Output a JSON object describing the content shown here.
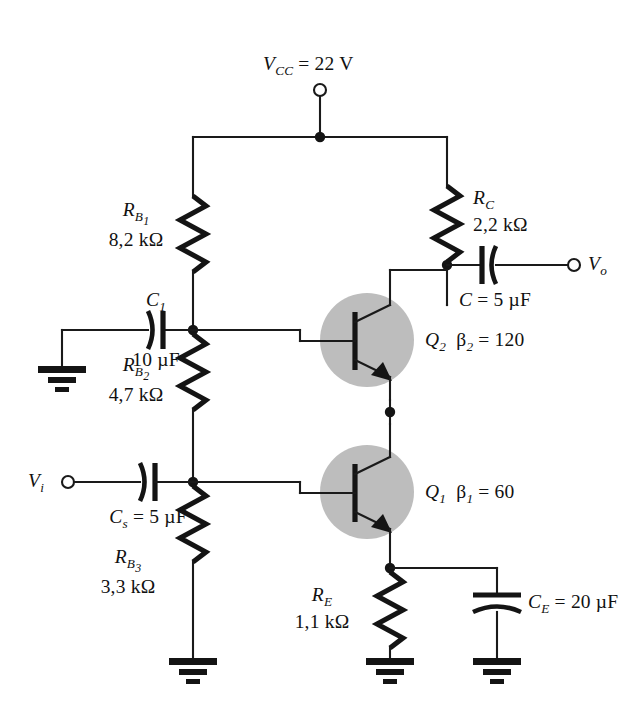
{
  "figure": {
    "type": "schematic",
    "background": "#ffffff",
    "ink_color": "#141414",
    "envelope_color": "#bdbdbd"
  },
  "supply": {
    "name": "V",
    "subscript": "CC",
    "equals": "=",
    "value": "22 V",
    "full": "VCC = 22 V"
  },
  "terminals": [
    {
      "id": "vcc",
      "label": "V",
      "sub": "CC",
      "text": "VCC"
    },
    {
      "id": "vin",
      "label": "V",
      "sub": "i",
      "text": "Vi"
    },
    {
      "id": "vout",
      "label": "V",
      "sub": "o",
      "text": "Vo"
    }
  ],
  "resistors": [
    {
      "id": "RB1",
      "name": "R",
      "sub": "B1",
      "sub_main": "B",
      "sub_index": "1",
      "value": "8,2 kΩ",
      "unit": "kΩ",
      "number": "8,2"
    },
    {
      "id": "RB2",
      "name": "R",
      "sub": "B2",
      "sub_main": "B",
      "sub_index": "2",
      "value": "4,7 kΩ",
      "unit": "kΩ",
      "number": "4,7"
    },
    {
      "id": "RB3",
      "name": "R",
      "sub": "B3",
      "sub_main": "B",
      "sub_index": "3",
      "value": "3,3 kΩ",
      "unit": "kΩ",
      "number": "3,3"
    },
    {
      "id": "RC",
      "name": "R",
      "sub": "C",
      "sub_main": "C",
      "sub_index": "",
      "value": "2,2 kΩ",
      "unit": "kΩ",
      "number": "2,2"
    },
    {
      "id": "RE",
      "name": "R",
      "sub": "E",
      "sub_main": "E",
      "sub_index": "",
      "value": "1,1 kΩ",
      "unit": "kΩ",
      "number": "1,1"
    }
  ],
  "capacitors": [
    {
      "id": "C1",
      "name": "C",
      "sub": "1",
      "value": "10 µF",
      "inline": false,
      "label_above": "C1",
      "label_below": "10 µF"
    },
    {
      "id": "Cs",
      "name": "C",
      "sub": "s",
      "equals": "=",
      "value": "5 µF",
      "inline": true,
      "text": "Cs = 5 µF"
    },
    {
      "id": "C",
      "name": "C",
      "sub": "",
      "equals": "=",
      "value": "5 µF",
      "inline": true,
      "text": "C = 5 µF"
    },
    {
      "id": "CE",
      "name": "C",
      "sub": "E",
      "equals": "=",
      "value": "20 µF",
      "inline": true,
      "text": "CE = 20 µF"
    }
  ],
  "transistors": [
    {
      "id": "Q2",
      "name": "Q",
      "sub": "2",
      "type": "npn",
      "beta_symbol": "β",
      "beta_sub": "2",
      "beta_equals": "=",
      "beta_value": "120",
      "text": "Q2  β2 = 120"
    },
    {
      "id": "Q1",
      "name": "Q",
      "sub": "1",
      "type": "npn",
      "beta_symbol": "β",
      "beta_sub": "1",
      "beta_equals": "=",
      "beta_value": "60",
      "text": "Q1  β1 = 60"
    }
  ],
  "grounds": [
    {
      "id": "gnd-input-c1"
    },
    {
      "id": "gnd-rb3"
    },
    {
      "id": "gnd-re"
    },
    {
      "id": "gnd-ce"
    }
  ]
}
